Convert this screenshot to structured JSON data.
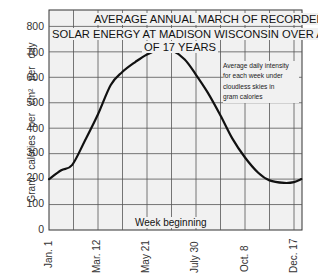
{
  "chart_data": {
    "type": "line",
    "title_lines": [
      "AVERAGE ANNUAL MARCH OF RECORDED",
      "SOLAR ENERGY AT MADISON WISCONSIN OVER A PERIOD",
      "OF 17 YEARS"
    ],
    "annotation": "Average daily intensity for each week under cloudless skies in gram calories",
    "annotation_lines": [
      "Average daily intensity",
      "for each week under",
      "cloudless skies in",
      "gram  calories"
    ],
    "xlabel": "Week beginning",
    "ylabel": "Gram  calories  per  cm²  per  day",
    "x_tick_labels": [
      "Jan. 1",
      "Mar. 12",
      "May 21",
      "July 30",
      "Oct. 8",
      "Dec. 17"
    ],
    "y_tick_labels": [
      "0",
      "100",
      "200",
      "300",
      "400",
      "500",
      "600",
      "700",
      "800"
    ],
    "ylim": [
      0,
      850
    ],
    "grid": true,
    "x_unit": "week index (0 = Jan. 1, 10 = Mar. 12, 20 = May 21, 30 = July 30, 40 = Oct. 8, 50 = Dec. 17)",
    "series": [
      {
        "name": "Average daily intensity",
        "x": [
          0,
          2.5,
          4.7,
          7.3,
          10,
          12.6,
          14.9,
          17.6,
          20,
          22.9,
          25,
          27.7,
          30,
          32.4,
          35,
          37.4,
          40,
          42.7,
          45,
          48,
          50,
          51.5
        ],
        "values": [
          200,
          235,
          255,
          350,
          455,
          570,
          620,
          660,
          690,
          712,
          707,
          670,
          610,
          540,
          450,
          360,
          285,
          225,
          195,
          185,
          188,
          200
        ]
      }
    ]
  }
}
